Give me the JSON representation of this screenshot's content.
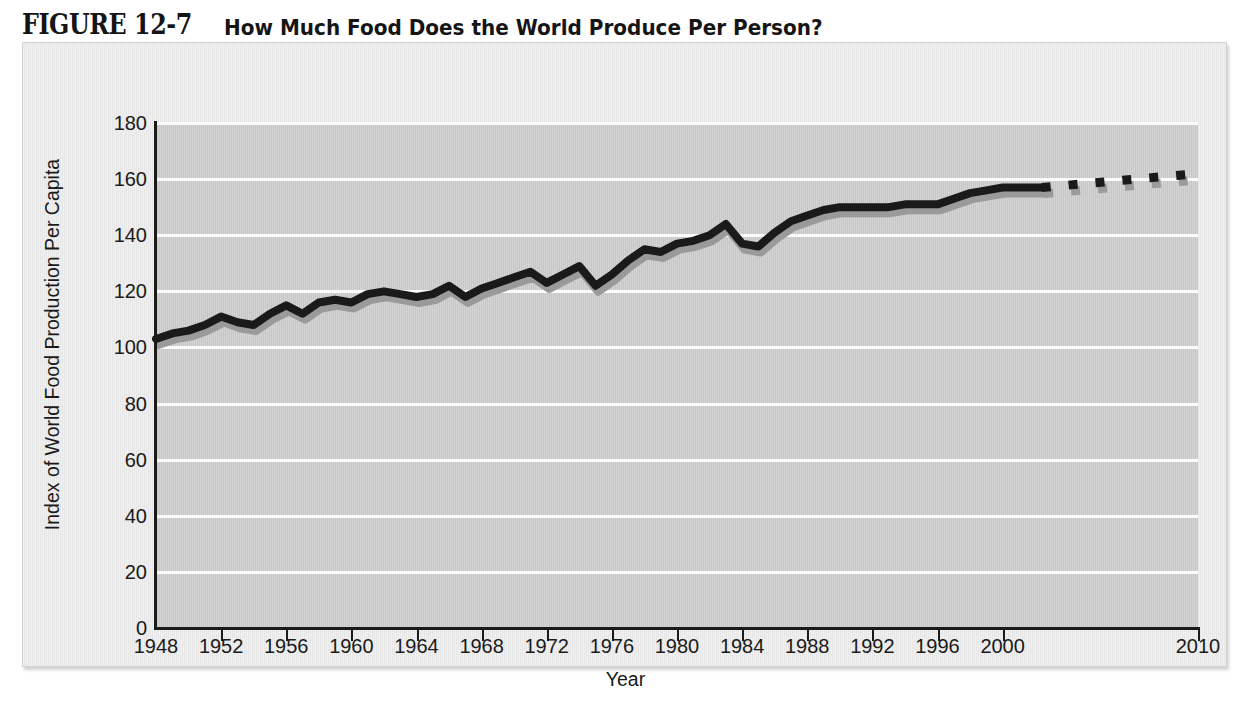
{
  "figure": {
    "number": "FIGURE 12-7",
    "title": "How Much Food Does the World Produce Per Person?"
  },
  "chart_data": {
    "type": "line",
    "title": "How Much Food Does the World Produce Per Person?",
    "xlabel": "Year",
    "ylabel": "Index of World Food Production Per Capita",
    "xlim": [
      1948,
      2010
    ],
    "ylim": [
      0,
      180
    ],
    "grid": true,
    "legend": null,
    "x_tick_labels": [
      "1948",
      "1952",
      "1956",
      "1960",
      "1964",
      "1968",
      "1972",
      "1976",
      "1980",
      "1984",
      "1988",
      "1992",
      "1996",
      "2000",
      "2010"
    ],
    "y_tick_labels": [
      "0",
      "20",
      "40",
      "60",
      "80",
      "100",
      "120",
      "140",
      "160",
      "180"
    ],
    "y_ticks": [
      0,
      20,
      40,
      60,
      80,
      100,
      120,
      140,
      160,
      180
    ],
    "note": "Final segment from 2002 to 2010 is drawn as a dashed projection; the x-axis is compressed between 2000 and 2010.",
    "series": [
      {
        "name": "Index of World Food Production Per Capita",
        "style": "solid-with-dashed-projection",
        "color": "#1a1a1a",
        "x": [
          1948,
          1949,
          1950,
          1951,
          1952,
          1953,
          1954,
          1955,
          1956,
          1957,
          1958,
          1959,
          1960,
          1961,
          1962,
          1963,
          1964,
          1965,
          1966,
          1967,
          1968,
          1969,
          1970,
          1971,
          1972,
          1973,
          1974,
          1975,
          1976,
          1977,
          1978,
          1979,
          1980,
          1981,
          1982,
          1983,
          1984,
          1985,
          1986,
          1987,
          1988,
          1989,
          1990,
          1991,
          1992,
          1993,
          1994,
          1995,
          1996,
          1997,
          1998,
          1999,
          2000,
          2001,
          2002
        ],
        "values": [
          103,
          105,
          106,
          108,
          111,
          109,
          108,
          112,
          115,
          112,
          116,
          117,
          116,
          119,
          120,
          119,
          118,
          119,
          122,
          118,
          121,
          123,
          125,
          127,
          123,
          126,
          129,
          122,
          126,
          131,
          135,
          134,
          137,
          138,
          140,
          144,
          137,
          136,
          141,
          145,
          147,
          149,
          150,
          150,
          150,
          150,
          151,
          151,
          151,
          153,
          155,
          156,
          157,
          157,
          157
        ]
      },
      {
        "name": "Projection",
        "style": "dashed",
        "color": "#1a1a1a",
        "x": [
          2002,
          2010
        ],
        "values": [
          157,
          162
        ]
      }
    ]
  }
}
